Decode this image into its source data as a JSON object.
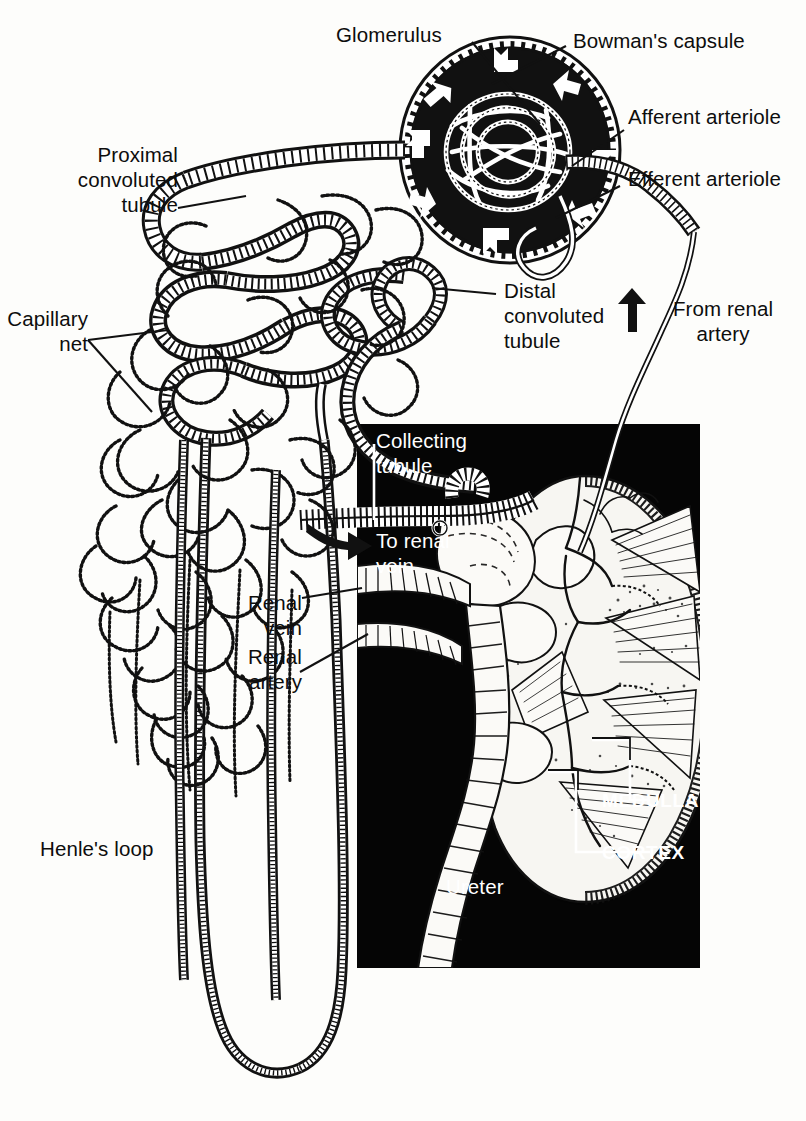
{
  "figure": {
    "background_color": "#ffffff",
    "inset_color": "#000000",
    "ink_color": "#0d0d0d"
  },
  "labels": {
    "glomerulus": "Glomerulus",
    "bowmans_capsule": "Bowman's capsule",
    "afferent_arteriole": "Afferent arteriole",
    "efferent_arteriole": "Efferent arteriole",
    "proximal_convoluted_tubule": "Proximal\nconvoluted\ntubule",
    "distal_convoluted_tubule": "Distal\nconvoluted\ntubule",
    "from_renal_artery": "From renal\nartery",
    "capillary_net": "Capillary\nnet",
    "collecting_tubule": "Collecting\ntubule",
    "to_renal_vein": "To renal\nvein",
    "renal_vein": "Renal\nvein",
    "renal_artery": "Renal\nartery",
    "medulla": "MEDULLA",
    "cortex": "CORTEX",
    "ureter": "Ureter",
    "henles_loop": "Henle's loop"
  },
  "icons": {
    "filtration_arrow": "arrow-icon",
    "blood_flow_in": "up-arrow-icon",
    "blood_flow_out": "right-arrow-icon"
  },
  "inset": {
    "x": 357,
    "y": 424,
    "width": 343,
    "height": 544
  }
}
